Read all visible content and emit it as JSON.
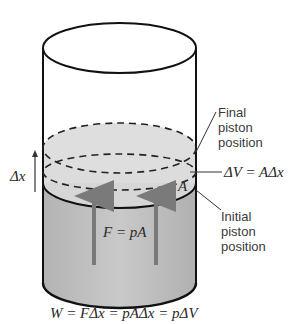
{
  "diagram": {
    "top_text_fragment": "",
    "labels": {
      "final_line1": "Final",
      "final_line2": "piston",
      "final_line3": "position",
      "initial_line1": "Initial",
      "initial_line2": "piston",
      "initial_line3": "position",
      "delta_v": "ΔV = AΔx",
      "delta_x": "Δx",
      "area": "A",
      "force": "F = pA",
      "work": "W = FΔx = pAΔx = pΔV"
    },
    "colors": {
      "outline": "#111111",
      "gas_fill": "#bdbdbd",
      "piston_top_fill": "#d9d9d9",
      "arrow": "#7a7a7a",
      "text": "#333333"
    }
  }
}
